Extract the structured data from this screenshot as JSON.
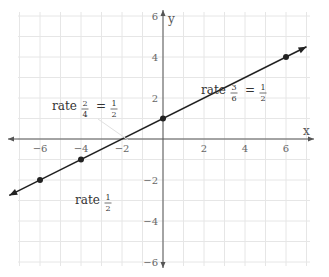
{
  "chart_data": {
    "type": "line",
    "title": "",
    "xlabel": "x",
    "ylabel": "y",
    "xlim": [
      -7,
      7
    ],
    "ylim": [
      -7,
      7
    ],
    "grid": true,
    "x_ticks": [
      -6,
      -4,
      -2,
      2,
      4,
      6
    ],
    "y_ticks": [
      6,
      4,
      2,
      -2,
      -4,
      -6
    ],
    "x_tick_labels": [
      "−6",
      "−4",
      "−2",
      "2",
      "4",
      "6"
    ],
    "y_tick_labels": [
      "6",
      "4",
      "2",
      "−2",
      "−4",
      "−6"
    ],
    "series": [
      {
        "name": "y = x/2 + 1",
        "slope": 0.5,
        "intercept": 1,
        "x": [
          -7.5,
          7.0
        ],
        "y": [
          -2.75,
          4.5
        ],
        "points": [
          [
            -6,
            -2
          ],
          [
            -4,
            -1
          ],
          [
            0,
            1
          ],
          [
            6,
            4
          ]
        ]
      }
    ],
    "annotations": [
      {
        "text": "rate",
        "num1": "2",
        "den1": "4",
        "num2": "1",
        "den2": "2",
        "anchor": [
          -4.5,
          1.8
        ]
      },
      {
        "text": "rate",
        "num1": "3",
        "den1": "6",
        "num2": "1",
        "den2": "2",
        "anchor": [
          1.8,
          4.3
        ]
      },
      {
        "text": "rate",
        "num2": "1",
        "den2": "2",
        "anchor": [
          -4.2,
          -3.0
        ]
      }
    ],
    "colors": {
      "line": "#222222",
      "grid": "#e6e6e6",
      "axis": "#555555"
    }
  },
  "labels": {
    "x_axis": "x",
    "y_axis": "y",
    "rate_word": "rate",
    "eq": "="
  }
}
